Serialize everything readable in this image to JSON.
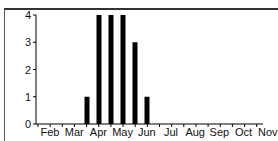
{
  "chart_data": {
    "type": "bar",
    "title": "",
    "xlabel": "",
    "ylabel": "",
    "ylim": [
      0,
      4
    ],
    "yticks": [
      0,
      1,
      2,
      3,
      4
    ],
    "xtick_labels": [
      "Feb",
      "Mar",
      "Apr",
      "May",
      "Jun",
      "Jul",
      "Aug",
      "Sep",
      "Oct",
      "Nov"
    ],
    "categories": [
      "late Apr",
      "early May",
      "late May",
      "early Jun",
      "late Jun",
      "early Jul"
    ],
    "values": [
      1,
      4,
      4,
      4,
      3,
      1
    ],
    "bar_color": "#000000",
    "grid": false,
    "legend": null
  }
}
